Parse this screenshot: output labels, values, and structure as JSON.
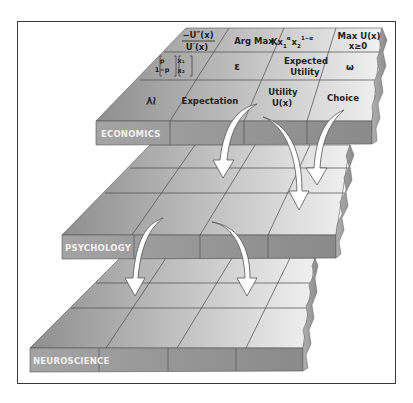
{
  "colors": {
    "frame": "#3a3a3a",
    "surface_dark": "#9a9a9a",
    "surface_light": "#ececec",
    "front_face": "#8c8c8c",
    "front_face_light": "#a8a8a8",
    "grid_line": "#4a4a4a",
    "label_text": "#f2f2f2",
    "arrow_fill": "#ffffff",
    "arrow_stroke": "#555555"
  },
  "layers": [
    {
      "id": "economics",
      "label": "ECONOMICS",
      "cells": [
        [
          "",
          "−U″(x) / U′(x)",
          "Arg Max",
          "Kx₁ᵅ x₂¹⁻ᵅ",
          "Max U(x) x≥0"
        ],
        [
          "",
          "[p, 1−p] [x₁, x₂]",
          "ε",
          "Expected Utility",
          "ω"
        ],
        [
          "",
          "≿",
          "Expectation",
          "Utility U(x)",
          "Choice"
        ]
      ],
      "row_texts": {
        "r0": [
          "−U″(x)",
          "U′(x)",
          "Arg Max",
          "Max U(x)",
          "x≥0"
        ],
        "r1_matrix_left": [
          "p",
          "1−p"
        ],
        "r1_matrix_right": [
          "x₁",
          "x₂"
        ],
        "r1": [
          "ε",
          "Expected",
          "Utility",
          "ω"
        ],
        "r2": [
          "≿",
          "Expectation",
          "Utility",
          "U(x)",
          "Choice"
        ]
      },
      "cobb_douglas": {
        "base": "Kx",
        "sub1": "1",
        "sup1": "α",
        "x2": "x",
        "sub2": "2",
        "sup2": "1−α"
      }
    },
    {
      "id": "psychology",
      "label": "PSYCHOLOGY",
      "cells": []
    },
    {
      "id": "neuroscience",
      "label": "NEUROSCIENCE",
      "cells": []
    }
  ],
  "arrows": [
    {
      "from": "economics",
      "to": "psychology",
      "source_cell": "Expectation"
    },
    {
      "from": "economics",
      "to": "psychology",
      "source_cell": "Utility U(x)"
    },
    {
      "from": "economics",
      "to": "psychology",
      "source_cell": "Choice"
    },
    {
      "from": "psychology",
      "to": "neuroscience",
      "source_cell": "column 1"
    },
    {
      "from": "psychology",
      "to": "neuroscience",
      "source_cell": "column 2"
    }
  ]
}
